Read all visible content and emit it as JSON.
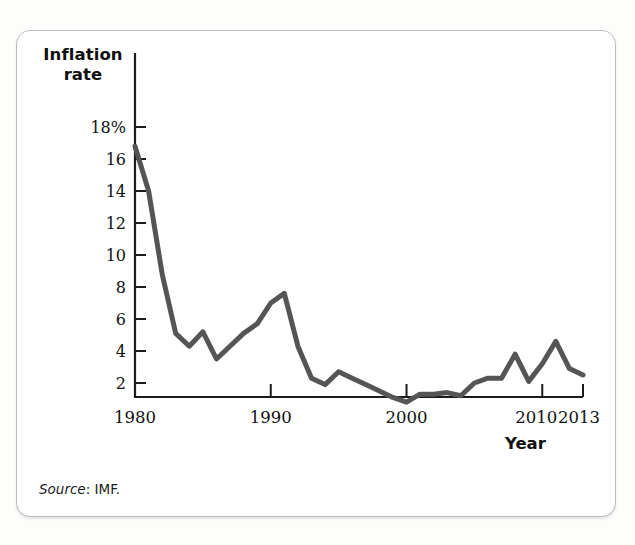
{
  "figure": {
    "source_label": "Source",
    "source_text": ": IMF."
  },
  "chart_data": {
    "type": "line",
    "title": "",
    "subtitle": "",
    "xlabel": "Year",
    "ylabel": "Inflation rate",
    "ylabel_line1": "Inflation",
    "ylabel_line2": "rate",
    "ylim": [
      0,
      19
    ],
    "xlim": [
      1980,
      2013
    ],
    "grid": false,
    "legend": "none",
    "y_tick_labels": [
      "18%",
      "16",
      "14",
      "12",
      "10",
      "8",
      "6",
      "4",
      "2"
    ],
    "y_tick_values": [
      18,
      16,
      14,
      12,
      10,
      8,
      6,
      4,
      2
    ],
    "x_tick_labels": [
      "1980",
      "1990",
      "2000",
      "2010",
      "2013"
    ],
    "x_tick_values": [
      1980,
      1990,
      2000,
      2010,
      2013
    ],
    "line_color": "#555555",
    "line_width": 5,
    "series": [
      {
        "name": "Inflation rate",
        "x": [
          1980,
          1981,
          1982,
          1983,
          1984,
          1985,
          1986,
          1987,
          1988,
          1989,
          1990,
          1991,
          1992,
          1993,
          1994,
          1995,
          1996,
          1997,
          1998,
          1999,
          2000,
          2001,
          2002,
          2003,
          2004,
          2005,
          2006,
          2007,
          2008,
          2009,
          2010,
          2011,
          2012,
          2013
        ],
        "values": [
          16.8,
          14.0,
          8.8,
          5.1,
          4.3,
          5.2,
          3.5,
          4.3,
          5.1,
          5.7,
          7.0,
          7.6,
          4.3,
          2.3,
          1.9,
          2.7,
          2.3,
          1.9,
          1.5,
          1.1,
          0.8,
          1.3,
          1.3,
          1.4,
          1.2,
          2.0,
          2.3,
          2.3,
          3.8,
          2.1,
          3.2,
          4.6,
          2.9,
          2.5
        ]
      }
    ],
    "annotations": []
  }
}
